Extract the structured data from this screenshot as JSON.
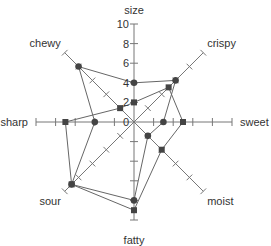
{
  "chart_data": {
    "type": "radar",
    "title": "",
    "axes": [
      "size",
      "crispy",
      "sweet",
      "moist",
      "fatty",
      "sour",
      "sharp",
      "chewy"
    ],
    "range": [
      0,
      10
    ],
    "tick_step": 2,
    "size_axis_tick_labels": [
      "0",
      "2",
      "4",
      "6",
      "8",
      "10"
    ],
    "grid": false,
    "legend": null,
    "series": [
      {
        "name": "series-1",
        "marker": "circle",
        "values": [
          4,
          6,
          3,
          2,
          8,
          9,
          4,
          8
        ]
      },
      {
        "name": "series-2",
        "marker": "square",
        "values": [
          2,
          5,
          5,
          4,
          9,
          9,
          7,
          2
        ]
      }
    ]
  },
  "colors": {
    "axis": "#777777",
    "line": "#666666",
    "marker": "#444444",
    "text": "#333333"
  }
}
